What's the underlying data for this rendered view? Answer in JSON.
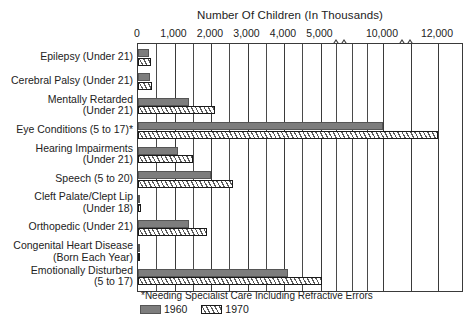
{
  "chart_data": {
    "type": "bar",
    "orientation": "horizontal",
    "title": "Number Of Children (In Thousands)",
    "xlabel": "Number Of Children (In Thousands)",
    "ylabel": "",
    "grid": true,
    "legend_position": "bottom-left",
    "xlim": [
      0,
      12500
    ],
    "xticks": [
      0,
      1000,
      2000,
      3000,
      4000,
      5000,
      10000,
      12000
    ],
    "xtick_labels": [
      "0",
      "1,000",
      "2,000",
      "3,000",
      "4,000",
      "5,000",
      "10,000",
      "12,000"
    ],
    "minor_tick_step": 500,
    "axis_breaks": [
      5500,
      11000
    ],
    "footnote": "*Needing Specialist Care Including Refractive Errors",
    "categories": [
      "Epilepsy (Under 21)",
      "Cerebral Palsy (Under 21)",
      "Mentally Retarded\n(Under 21)",
      "Eye Conditions (5 to 17)*",
      "Hearing Impairments\n(Under 21)",
      "Speech (5 to 20)",
      "Cleft Palate/Clept Lip\n(Under 18)",
      "Orthopedic (Under 21)",
      "Congenital Heart Disease\n(Born Each Year)",
      "Emotionally Disturbed\n(5 to 17)"
    ],
    "series": [
      {
        "name": "1960",
        "color": "#7d7d7d",
        "pattern": "solid",
        "values": [
          310,
          330,
          1400,
          10000,
          1100,
          2000,
          50,
          1400,
          40,
          4100
        ]
      },
      {
        "name": "1970",
        "color": "#ffffff",
        "pattern": "hatched",
        "values": [
          350,
          370,
          2100,
          12000,
          1500,
          2600,
          70,
          1900,
          55,
          5100
        ]
      }
    ]
  },
  "legend": {
    "items": [
      {
        "label": "1960",
        "swatch": "solid-gray"
      },
      {
        "label": "1970",
        "swatch": "diagonal-hatch"
      }
    ]
  },
  "figure": {
    "caption": ""
  }
}
